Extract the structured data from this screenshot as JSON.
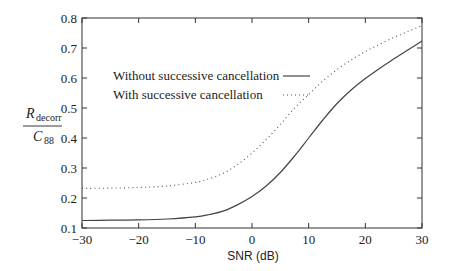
{
  "chart_data": {
    "type": "line",
    "title": "",
    "xlabel": "SNR (dB)",
    "ylabel": {
      "numerator_main": "R",
      "numerator_sub": "decorr",
      "denominator_main": "C",
      "denominator_sub": "88"
    },
    "xlim": [
      -30,
      30
    ],
    "ylim": [
      0.1,
      0.8
    ],
    "xticks": [
      -30,
      -20,
      -10,
      0,
      10,
      20,
      30
    ],
    "xtick_labels": [
      "−30",
      "−20",
      "−10",
      "0",
      "10",
      "20",
      "30"
    ],
    "yticks": [
      0.1,
      0.2,
      0.3,
      0.4,
      0.5,
      0.6,
      0.7,
      0.8
    ],
    "ytick_labels": [
      "0.1",
      "0.2",
      "0.3",
      "0.4",
      "0.5",
      "0.6",
      "0.7",
      "0.8"
    ],
    "grid": false,
    "legend_position": "upper-left-inside",
    "series": [
      {
        "name": "Without successive cancellation",
        "style": "solid",
        "x": [
          -30,
          -25,
          -20,
          -15,
          -10,
          -7.5,
          -5,
          -2.5,
          0,
          2.5,
          5,
          7.5,
          10,
          12.5,
          15,
          17.5,
          20,
          22.5,
          25,
          27.5,
          30
        ],
        "y": [
          0.125,
          0.126,
          0.127,
          0.13,
          0.137,
          0.145,
          0.157,
          0.178,
          0.205,
          0.24,
          0.285,
          0.34,
          0.4,
          0.46,
          0.515,
          0.56,
          0.598,
          0.632,
          0.663,
          0.693,
          0.723
        ]
      },
      {
        "name": "With successive cancellation",
        "style": "dotted",
        "x": [
          -30,
          -25,
          -20,
          -15,
          -10,
          -7.5,
          -5,
          -2.5,
          0,
          2.5,
          5,
          7.5,
          10,
          12.5,
          15,
          17.5,
          20,
          22.5,
          25,
          27.5,
          30
        ],
        "y": [
          0.232,
          0.233,
          0.235,
          0.24,
          0.252,
          0.265,
          0.283,
          0.312,
          0.35,
          0.395,
          0.445,
          0.5,
          0.545,
          0.59,
          0.628,
          0.66,
          0.688,
          0.712,
          0.735,
          0.755,
          0.775
        ]
      }
    ]
  },
  "colors": {
    "axis": "#333333",
    "solid_line": "#444444",
    "dotted_line": "#555555",
    "background": "#ffffff"
  }
}
